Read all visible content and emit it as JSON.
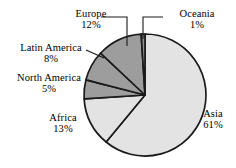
{
  "chart_data": {
    "type": "pie",
    "title": "",
    "subtitle": "",
    "xlabel": "",
    "ylabel": "",
    "legend_position": "none",
    "grid": false,
    "units": "percent",
    "categories": [
      "Asia",
      "Africa",
      "Europe",
      "Latin America",
      "North America",
      "Oceania"
    ],
    "values": [
      61,
      13,
      12,
      8,
      5,
      1
    ],
    "slices": [
      {
        "name": "Asia",
        "label": "Asia",
        "value": 61,
        "value_label": "61%",
        "color": "#e3e3e3",
        "label_position": "right",
        "has_leader_line": false
      },
      {
        "name": "Africa",
        "label": "Africa",
        "value": 13,
        "value_label": "13%",
        "color": "#e3e3e3",
        "label_position": "lower-left",
        "has_leader_line": false
      },
      {
        "name": "Europe",
        "label": "Europe",
        "value": 12,
        "value_label": "12%",
        "color": "#9d9d9d",
        "label_position": "top-left",
        "has_leader_line": true
      },
      {
        "name": "Latin America",
        "label": "Latin America",
        "value": 8,
        "value_label": "8%",
        "color": "#9d9d9d",
        "label_position": "left",
        "has_leader_line": true
      },
      {
        "name": "North America",
        "label": "North America",
        "value": 5,
        "value_label": "5%",
        "color": "#9d9d9d",
        "label_position": "left",
        "has_leader_line": true
      },
      {
        "name": "Oceania",
        "label": "Oceania",
        "value": 1,
        "value_label": "1%",
        "color": "#8f8f8f",
        "label_position": "top-right",
        "has_leader_line": true
      }
    ],
    "colors": {
      "light_gray": "#e3e3e3",
      "dark_gray": "#9d9d9d",
      "outline": "#1a1a1a",
      "background": "#ffffff",
      "text": "#000000"
    }
  },
  "labels": {
    "europe": {
      "name": "Europe",
      "value": "12%"
    },
    "oceania": {
      "name": "Oceania",
      "value": "1%"
    },
    "latin_america": {
      "name": "Latin America",
      "value": "8%"
    },
    "north_america": {
      "name": "North America",
      "value": "5%"
    },
    "africa": {
      "name": "Africa",
      "value": "13%"
    },
    "asia": {
      "name": "Asia",
      "value": "61%"
    }
  }
}
